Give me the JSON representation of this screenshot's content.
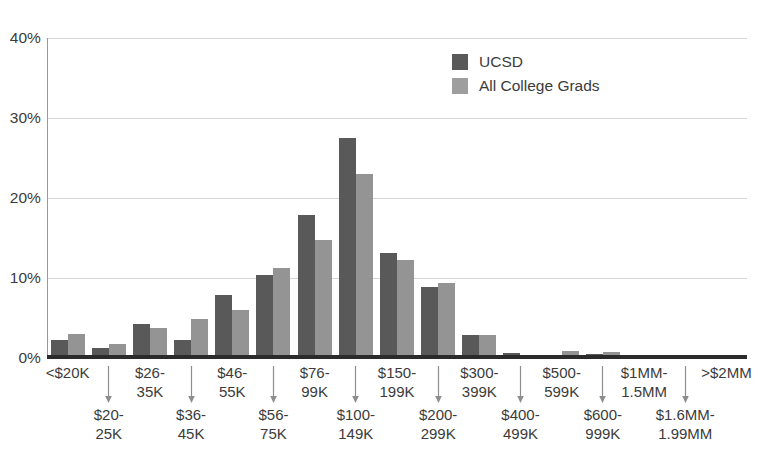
{
  "chart_data": {
    "type": "bar",
    "title": "",
    "subtitle": "",
    "xlabel": "",
    "ylabel": "",
    "ylim": [
      0,
      40
    ],
    "ytick_labels": [
      "0%",
      "10%",
      "20%",
      "30%",
      "40%"
    ],
    "ytick_values": [
      0,
      10,
      20,
      30,
      40
    ],
    "grid": "horizontal",
    "legend_position": "top-center-right",
    "categories": [
      "<$20K",
      "$20-25K",
      "$26-35K",
      "$36-45K",
      "$46-55K",
      "$56-75K",
      "$76-99K",
      "$100-149K",
      "$150-199K",
      "$200-299K",
      "$300-399K",
      "$400-499K",
      "$500-599K",
      "$600-999K",
      "$1MM-1.5MM",
      "$1.6MM-1.99MM",
      ">$2MM"
    ],
    "category_lines": [
      [
        "<$20K"
      ],
      [
        "$20-",
        "25K"
      ],
      [
        "$26-",
        "35K"
      ],
      [
        "$36-",
        "45K"
      ],
      [
        "$46-",
        "55K"
      ],
      [
        "$56-",
        "75K"
      ],
      [
        "$76-",
        "99K"
      ],
      [
        "$100-",
        "149K"
      ],
      [
        "$150-",
        "199K"
      ],
      [
        "$200-",
        "299K"
      ],
      [
        "$300-",
        "399K"
      ],
      [
        "$400-",
        "499K"
      ],
      [
        "$500-",
        "599K"
      ],
      [
        "$600-",
        "999K"
      ],
      [
        "$1MM-",
        "1.5MM"
      ],
      [
        "$1.6MM-",
        "1.99MM"
      ],
      [
        ">$2MM"
      ]
    ],
    "series": [
      {
        "name": "UCSD",
        "color": "#595959",
        "values": [
          2.2,
          1.3,
          4.2,
          2.2,
          7.9,
          10.4,
          17.9,
          27.5,
          13.1,
          8.9,
          2.9,
          0.6,
          0.3,
          0.5,
          0.2,
          0.3,
          0.1
        ]
      },
      {
        "name": "All College Grads",
        "color": "#949494",
        "values": [
          3.0,
          1.8,
          3.7,
          4.9,
          6.0,
          11.2,
          14.7,
          23.0,
          12.3,
          9.4,
          2.9,
          0.2,
          0.9,
          0.7,
          0.4,
          0.2,
          0.2
        ]
      }
    ]
  },
  "legend": {
    "items": [
      {
        "label": "UCSD",
        "color": "#595959"
      },
      {
        "label": "All College Grads",
        "color": "#9e9e9e"
      }
    ]
  },
  "axis": {
    "y_ticks": [
      "40%",
      "30%",
      "20%",
      "10%",
      "0%"
    ]
  }
}
